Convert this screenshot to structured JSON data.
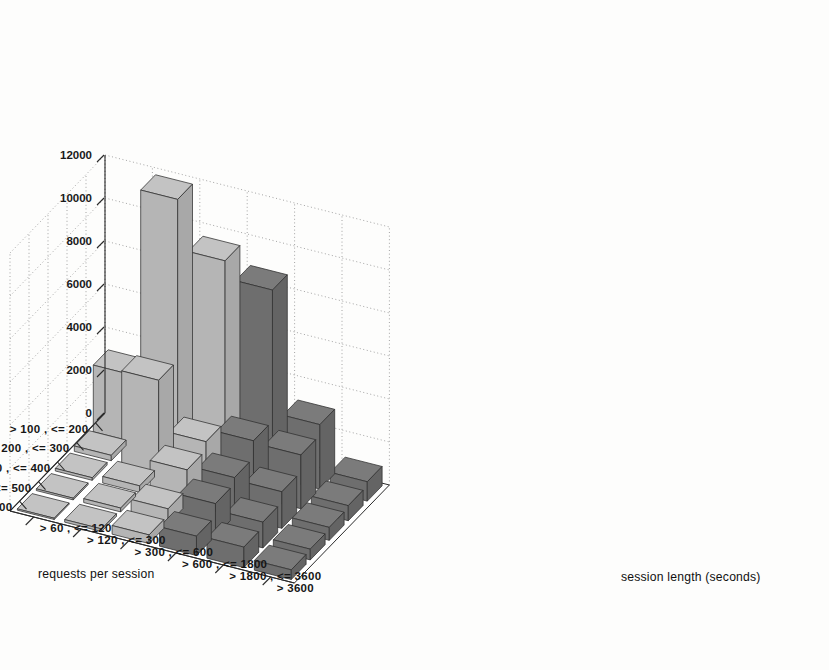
{
  "figure": {
    "kind": "3d-bar-surface-plot",
    "background_color": "#fdfdfc"
  },
  "axes": {
    "z": {
      "title": "",
      "tick_labels": [
        "0",
        "2000",
        "4000",
        "6000",
        "8000",
        "10000",
        "12000"
      ],
      "tick_values": [
        0,
        2000,
        4000,
        6000,
        8000,
        10000,
        12000
      ],
      "min": 0,
      "max": 12000
    },
    "left": {
      "title": "requests per session",
      "categories": [
        "> 100 , <= 200",
        "> 200 , <= 300",
        "> 300 , <= 400",
        "> 400 , <= 500",
        "> 500"
      ]
    },
    "right": {
      "title": "session length (seconds)",
      "categories": [
        "> 60 , <= 120",
        "> 120 , <= 300",
        "> 300 , <= 600",
        "> 600 , <= 1800",
        "> 1800 , <= 3600",
        "> 3600"
      ]
    }
  },
  "colors": {
    "bar_top_light": "#c3c3c3",
    "bar_left_light": "#b5b5b5",
    "bar_right_light": "#a8a8a8",
    "bar_top_dark": "#7b7b7b",
    "bar_left_dark": "#6e6e6e",
    "bar_right_dark": "#646464",
    "edge": "#2f2f2f",
    "grid": "#9a9a9a",
    "axis": "#2b2b2b",
    "text": "#161616"
  },
  "chart_data": {
    "type": "bar",
    "title": "",
    "subtitle": "",
    "xlabel": "session length (seconds)",
    "ylabel": "requests per session",
    "zlabel": "",
    "grid": true,
    "legend": "none",
    "zlim": [
      0,
      12000
    ],
    "ztick_step": 2000,
    "x_categories": [
      "> 60 , <= 120",
      "> 120 , <= 300",
      "> 300 , <= 600",
      "> 600 , <= 1800",
      "> 1800 , <= 3600",
      "> 3600"
    ],
    "y_categories": [
      "> 100 , <= 200",
      "> 200 , <= 300",
      "> 300 , <= 400",
      "> 400 , <= 500",
      "> 500"
    ],
    "note": "values[y_index][x_index]; y_index follows requests-per-session order, x_index follows session-length order",
    "values": [
      [
        3100,
        11800,
        9500,
        8700,
        3000,
        900
      ],
      [
        250,
        4300,
        2000,
        2600,
        2500,
        700
      ],
      [
        120,
        300,
        1600,
        1800,
        1700,
        600
      ],
      [
        80,
        180,
        700,
        1500,
        1200,
        500
      ],
      [
        60,
        120,
        400,
        900,
        950,
        450
      ]
    ],
    "series": [
      {
        "name": "> 100 , <= 200",
        "values": [
          3100,
          11800,
          9500,
          8700,
          3000,
          900
        ]
      },
      {
        "name": "> 200 , <= 300",
        "values": [
          250,
          4300,
          2000,
          2600,
          2500,
          700
        ]
      },
      {
        "name": "> 300 , <= 400",
        "values": [
          120,
          300,
          1600,
          1800,
          1700,
          600
        ]
      },
      {
        "name": "> 400 , <= 500",
        "values": [
          80,
          180,
          700,
          1500,
          1200,
          500
        ]
      },
      {
        "name": "> 500",
        "values": [
          60,
          120,
          400,
          900,
          950,
          450
        ]
      }
    ]
  }
}
